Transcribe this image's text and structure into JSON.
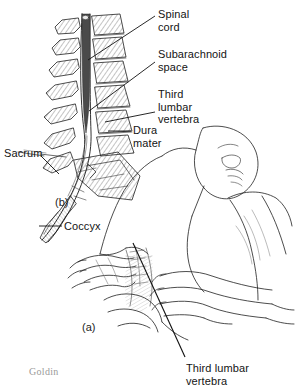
{
  "figure": {
    "background_color": "#ffffff",
    "ink_color": "#1a1a1a",
    "cord_color": "#4a4a4a",
    "signature": "Goldin"
  },
  "panels": [
    {
      "id": "a",
      "label": "(a)",
      "caption": "Patient positioned laterally for lumbar puncture"
    },
    {
      "id": "b",
      "label": "(b)",
      "caption": "Sagittal section of lumbosacral spine"
    }
  ],
  "labels": [
    {
      "name": "spinal-cord",
      "text": "Spinal\ncord",
      "x": 158,
      "y": 8
    },
    {
      "name": "subarachnoid-space",
      "text": "Subarachnoid\nspace",
      "x": 158,
      "y": 48
    },
    {
      "name": "third-lumbar-vertebra-b",
      "text": "Third\nlumbar\nvertebra",
      "x": 158,
      "y": 88
    },
    {
      "name": "dura-mater",
      "text": "Dura\nmater",
      "x": 133,
      "y": 124
    },
    {
      "name": "sacrum",
      "text": "Sacrum",
      "x": 4,
      "y": 147
    },
    {
      "name": "coccyx",
      "text": "Coccyx",
      "x": 64,
      "y": 220
    },
    {
      "name": "third-lumbar-vertebra-a",
      "text": "Third lumbar\nvertebra",
      "x": 186,
      "y": 362
    }
  ],
  "leaders": [
    {
      "name": "leader-spinal-cord",
      "x1": 155,
      "y1": 16,
      "x2": 88,
      "y2": 60
    },
    {
      "name": "leader-subarachnoid-space",
      "x1": 155,
      "y1": 62,
      "x2": 89,
      "y2": 111
    },
    {
      "name": "leader-third-lumbar-vertebra-b",
      "x1": 155,
      "y1": 112,
      "x2": 105,
      "y2": 122
    },
    {
      "name": "leader-dura-mater",
      "x1": 131,
      "y1": 131,
      "x2": 108,
      "y2": 131
    },
    {
      "name": "leader-sacrum",
      "x1": 41,
      "y1": 156,
      "x2": 59,
      "y2": 174
    },
    {
      "name": "leader-coccyx",
      "x1": 62,
      "y1": 226,
      "x2": 39,
      "y2": 226
    },
    {
      "name": "leader-third-lumbar-vertebra-a",
      "x1": 133,
      "y1": 243,
      "x2": 185,
      "y2": 357
    }
  ],
  "anatomy": {
    "spinal_cord": "dark tapering cord ending in conus medullaris",
    "vertebrae_count": 9,
    "hatching": "diagonal line shading on vertebral bodies",
    "patient": "prone/side-lying adult with clinician hands palpating the lower back"
  }
}
